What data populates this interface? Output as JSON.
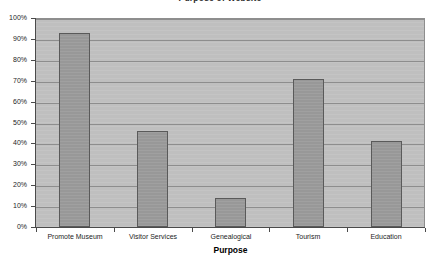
{
  "chart_data": {
    "type": "bar",
    "title": "Purpose of Website",
    "xlabel": "Purpose",
    "ylabel": "",
    "categories": [
      "Promote Museum",
      "Visitor Services",
      "Genealogical",
      "Tourism",
      "Education"
    ],
    "values": [
      93,
      46,
      14,
      71,
      41
    ],
    "ylim": [
      0,
      100
    ],
    "ytick_labels": [
      "0%",
      "10%",
      "20%",
      "30%",
      "40%",
      "50%",
      "60%",
      "70%",
      "80%",
      "90%",
      "100%"
    ],
    "ytick_values": [
      0,
      10,
      20,
      30,
      40,
      50,
      60,
      70,
      80,
      90,
      100
    ],
    "grid": true,
    "legend": false,
    "series": [
      {
        "name": "Purpose",
        "values": [
          93,
          46,
          14,
          71,
          41
        ]
      }
    ],
    "colors": {
      "bar_fill": "#9b9b9b",
      "bar_border": "#5a5a5a",
      "plot_background": "#c1c1c1",
      "gridline": "#8d8d8d",
      "axis": "#4a4a4a",
      "page_background": "#ffffff",
      "text": "#1d1d1d"
    }
  }
}
